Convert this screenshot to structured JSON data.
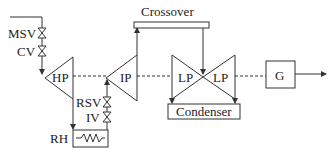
{
  "diagram": {
    "type": "steam turbine schematic",
    "components": {
      "msv": "MSV",
      "cv": "CV",
      "hp": "HP",
      "ip": "IP",
      "lp_left": "LP",
      "lp_right": "LP",
      "crossover": "Crossover",
      "condenser": "Condenser",
      "generator": "G",
      "rsv": "RSV",
      "iv": "IV",
      "rh": "RH"
    },
    "connections": [
      {
        "from": "steam inlet",
        "to": "MSV"
      },
      {
        "from": "MSV",
        "to": "CV"
      },
      {
        "from": "CV",
        "to": "HP"
      },
      {
        "from": "HP",
        "to": "RH"
      },
      {
        "from": "RH",
        "to": "IV"
      },
      {
        "from": "IV",
        "to": "RSV"
      },
      {
        "from": "RSV",
        "to": "IP"
      },
      {
        "from": "IP",
        "to": "Crossover"
      },
      {
        "from": "Crossover",
        "to": "LP"
      },
      {
        "from": "LP",
        "to": "Condenser"
      },
      {
        "from": "shaft",
        "to": "G"
      },
      {
        "from": "G",
        "to": "output"
      }
    ]
  }
}
